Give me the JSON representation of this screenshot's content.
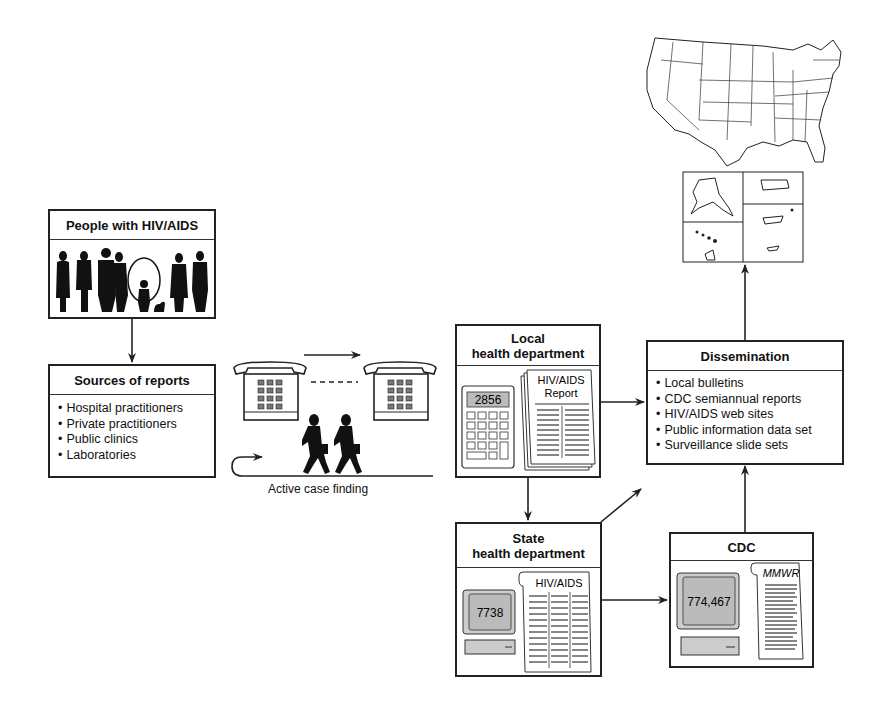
{
  "diagram": {
    "type": "HIV/AIDS surveillance reporting flow",
    "nodes": {
      "people": {
        "title": "People with HIV/AIDS",
        "icon": "people-silhouettes-icon"
      },
      "sources": {
        "title": "Sources of reports",
        "items": [
          "Hospital practitioners",
          "Private practitioners",
          "Public clinics",
          "Laboratories"
        ]
      },
      "active_case_finding": {
        "label": "Active case finding",
        "icons": [
          "telephone-icon",
          "telephone-icon",
          "walking-people-icon"
        ]
      },
      "local": {
        "title_line1": "Local",
        "title_line2": "health department",
        "calculator_display": "2856",
        "report_title_line1": "HIV/AIDS",
        "report_title_line2": "Report"
      },
      "state": {
        "title_line1": "State",
        "title_line2": "health department",
        "computer_display": "7738",
        "report_title": "HIV/AIDS"
      },
      "cdc": {
        "title": "CDC",
        "computer_display": "774,467",
        "report_title": "MMWR"
      },
      "dissemination": {
        "title": "Dissemination",
        "items": [
          "Local bulletins",
          "CDC semiannual reports",
          "HIV/AIDS web sites",
          "Public information data set",
          "Surveillance slide sets"
        ]
      },
      "map": {
        "icon": "us-map-icon",
        "insets": [
          "Alaska",
          "Puerto Rico",
          "Hawaii",
          "Pacific islands"
        ]
      }
    },
    "edges": [
      [
        "people",
        "sources"
      ],
      [
        "sources",
        "active_case_finding"
      ],
      [
        "active_case_finding",
        "local"
      ],
      [
        "local",
        "dissemination"
      ],
      [
        "local",
        "state"
      ],
      [
        "state",
        "dissemination"
      ],
      [
        "state",
        "cdc"
      ],
      [
        "cdc",
        "dissemination"
      ],
      [
        "dissemination",
        "map"
      ]
    ]
  }
}
